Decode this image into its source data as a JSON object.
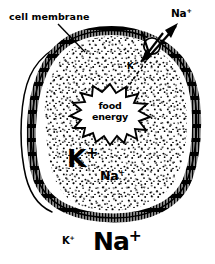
{
  "figure": {
    "type": "biology-diagram",
    "background_color": "#ffffff",
    "ink_color": "#000000"
  },
  "labels": {
    "cell_membrane": "cell membrane",
    "sodium_out_top": "Na",
    "sodium_out_top_charge": "+",
    "potassium_pump": "K",
    "potassium_pump_charge": "+",
    "food_energy_line1": "food",
    "food_energy_line2": "energy",
    "potassium_inside": "K",
    "potassium_inside_charge": "+",
    "sodium_inside": "Na",
    "sodium_inside_charge": "+",
    "potassium_outside_bottom": "K",
    "potassium_outside_bottom_charge": "+",
    "sodium_outside_bottom": "Na",
    "sodium_outside_bottom_charge": "+"
  },
  "icons": {
    "cell_body": "cell-blob-shape",
    "membrane": "hatched-membrane-band",
    "cytoplasm": "stippled-fill",
    "pump": "pump-circle",
    "efflux_arrow": "arrow-up-right",
    "influx_arrow": "arrow-down-left",
    "energy_burst": "starburst-shape",
    "leader_line": "leader-line",
    "energy_link": "dashed-line"
  }
}
